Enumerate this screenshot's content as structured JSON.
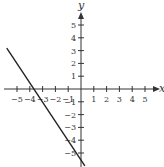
{
  "chart_data": {
    "type": "line",
    "title": "",
    "xlabel": "x",
    "ylabel": "y",
    "xlim": [
      -6.3,
      6.4
    ],
    "ylim": [
      -6.0,
      7.0
    ],
    "x_ticks": [
      -5,
      -4,
      -3,
      -2,
      -1,
      1,
      2,
      3,
      4,
      5
    ],
    "y_ticks": [
      -5,
      -4,
      -3,
      -2,
      -1,
      1,
      2,
      3,
      4,
      5
    ],
    "x_tick_labels": [
      "−5",
      "−4",
      "−3",
      "−2",
      "−1",
      "1",
      "2",
      "3",
      "4",
      "5"
    ],
    "y_tick_labels": [
      "−5",
      "−4",
      "−3",
      "−2",
      "−1",
      "1",
      "2",
      "3",
      "4",
      "5"
    ],
    "grid": false,
    "legend": null,
    "series": [
      {
        "name": "line",
        "equation": "y = -1.5x - 5.5",
        "slope": -1.5,
        "intercept": -5.5,
        "x_intercept": -3.67,
        "x": [
          -5.8,
          0.3
        ],
        "y": [
          3.2,
          -6.0
        ],
        "color": "#222222"
      }
    ]
  },
  "colors": {
    "axis": "#333333",
    "line": "#222222",
    "background": "#ffffff"
  }
}
